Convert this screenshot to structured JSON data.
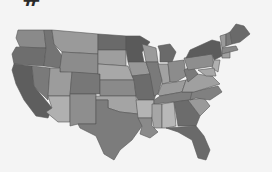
{
  "header": {
    "cropped_glyph": "#"
  },
  "map": {
    "title": "",
    "region": "United States",
    "style": "grayscale choropleth",
    "background": "#f4f4f4",
    "border_color": "#555555",
    "states": [
      {
        "id": "WA",
        "fill": "#8a8a8a",
        "points": "18,30 44,30 46,48 20,47 16,38"
      },
      {
        "id": "OR",
        "fill": "#6e6e6e",
        "points": "16,47 46,48 44,66 14,64 12,54"
      },
      {
        "id": "CA",
        "fill": "#5e5e5e",
        "points": "14,64 32,66 34,86 52,108 48,118 36,116 24,100 16,84 12,70"
      },
      {
        "id": "NV",
        "fill": "#7a7a7a",
        "points": "32,66 50,68 48,100 34,86"
      },
      {
        "id": "ID",
        "fill": "#747474",
        "points": "44,30 52,30 54,44 62,56 60,68 44,66 46,48"
      },
      {
        "id": "MT",
        "fill": "#9a9a9a",
        "points": "52,30 98,34 98,54 62,52 54,44"
      },
      {
        "id": "WY",
        "fill": "#8c8c8c",
        "points": "62,52 98,54 98,74 60,72 60,68"
      },
      {
        "id": "UT",
        "fill": "#9c9c9c",
        "points": "50,68 60,68 60,72 72,72 70,96 48,96"
      },
      {
        "id": "AZ",
        "fill": "#b0b0b0",
        "points": "48,96 70,96 70,122 58,122 46,112 52,108"
      },
      {
        "id": "CO",
        "fill": "#777777",
        "points": "72,72 100,74 100,94 70,94"
      },
      {
        "id": "NM",
        "fill": "#8e8e8e",
        "points": "70,94 96,94 96,124 78,124 70,126"
      },
      {
        "id": "ND",
        "fill": "#6a6a6a",
        "points": "98,34 126,36 126,50 98,50"
      },
      {
        "id": "SD",
        "fill": "#9e9e9e",
        "points": "98,50 126,50 126,66 98,64"
      },
      {
        "id": "NE",
        "fill": "#a8a8a8",
        "points": "98,64 128,66 134,80 100,80 100,74 98,74"
      },
      {
        "id": "KS",
        "fill": "#8a8a8a",
        "points": "100,80 134,80 136,96 100,96"
      },
      {
        "id": "OK",
        "fill": "#a4a4a4",
        "points": "96,96 136,96 138,114 120,112 108,108 108,100 96,100"
      },
      {
        "id": "TX",
        "fill": "#7c7c7c",
        "points": "96,100 108,100 108,108 120,112 138,114 142,126 132,140 120,150 114,160 104,154 96,136 80,128 78,124 96,124"
      },
      {
        "id": "MN",
        "fill": "#5a5a5a",
        "points": "126,36 140,36 150,42 142,52 144,62 128,62 126,50"
      },
      {
        "id": "IA",
        "fill": "#989898",
        "points": "128,62 146,62 150,74 132,76"
      },
      {
        "id": "MO",
        "fill": "#6c6c6c",
        "points": "132,76 150,74 156,94 154,100 138,100 136,96 134,80"
      },
      {
        "id": "AR",
        "fill": "#b4b4b4",
        "points": "136,100 154,100 152,118 138,118"
      },
      {
        "id": "LA",
        "fill": "#8a8a8a",
        "points": "138,118 152,118 152,126 158,132 150,138 140,134 142,126"
      },
      {
        "id": "WI",
        "fill": "#9a9a9a",
        "points": "142,44 156,48 158,62 146,62 144,52"
      },
      {
        "id": "IL",
        "fill": "#7a7a7a",
        "points": "146,62 158,62 162,80 158,94 154,96 150,74"
      },
      {
        "id": "MI",
        "fill": "#6a6a6a",
        "points": "158,46 170,44 176,52 172,62 160,62 160,52"
      },
      {
        "id": "IN",
        "fill": "#a2a2a2",
        "points": "158,64 168,64 170,82 162,84 162,80"
      },
      {
        "id": "OH",
        "fill": "#8c8c8c",
        "points": "168,62 184,60 186,76 176,82 170,82"
      },
      {
        "id": "KY",
        "fill": "#9c9c9c",
        "points": "158,94 162,84 176,82 186,80 182,92 160,96"
      },
      {
        "id": "TN",
        "fill": "#7e7e7e",
        "points": "154,100 160,96 182,92 196,92 192,100 154,104"
      },
      {
        "id": "MS",
        "fill": "#a6a6a6",
        "points": "152,104 162,104 162,128 154,128 152,118"
      },
      {
        "id": "AL",
        "fill": "#b8b8b8",
        "points": "162,104 174,102 176,126 166,128 162,128"
      },
      {
        "id": "GA",
        "fill": "#6c6c6c",
        "points": "174,102 188,100 200,116 196,126 178,126"
      },
      {
        "id": "FL",
        "fill": "#6a6a6a",
        "points": "166,128 196,126 204,136 210,150 206,160 198,158 192,140 178,132"
      },
      {
        "id": "SC",
        "fill": "#9a9a9a",
        "points": "188,100 204,98 210,106 200,116"
      },
      {
        "id": "NC",
        "fill": "#808080",
        "points": "192,92 218,86 222,92 210,100 196,98 190,100"
      },
      {
        "id": "VA",
        "fill": "#a0a0a0",
        "points": "186,80 196,74 212,76 220,84 194,92 182,92"
      },
      {
        "id": "WV",
        "fill": "#7a7a7a",
        "points": "184,70 192,66 198,74 188,82 186,76"
      },
      {
        "id": "PA",
        "fill": "#8e8e8e",
        "points": "184,58 212,54 214,66 188,70"
      },
      {
        "id": "NY",
        "fill": "#5c5c5c",
        "points": "190,50 212,40 220,42 222,56 214,60 212,54 186,58"
      },
      {
        "id": "NJ",
        "fill": "#b0b0b0",
        "points": "214,60 220,60 218,72 212,68"
      },
      {
        "id": "MD",
        "fill": "#a8a8a8",
        "points": "198,70 214,68 216,76 206,76"
      },
      {
        "id": "VT",
        "fill": "#9a9a9a",
        "points": "220,36 226,34 226,46 222,48"
      },
      {
        "id": "NH",
        "fill": "#7a7a7a",
        "points": "226,34 230,32 232,44 226,46"
      },
      {
        "id": "ME",
        "fill": "#6a6a6a",
        "points": "230,32 236,24 244,26 250,34 240,42 232,44"
      },
      {
        "id": "MA",
        "fill": "#888888",
        "points": "222,48 236,46 238,50 222,54"
      },
      {
        "id": "CT",
        "fill": "#a0a0a0",
        "points": "222,54 230,52 230,58 222,58"
      }
    ]
  }
}
